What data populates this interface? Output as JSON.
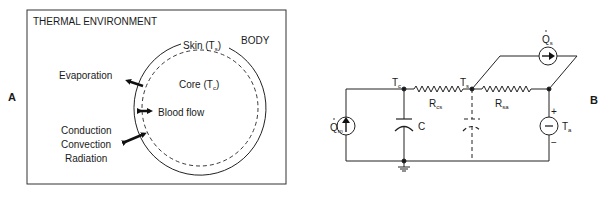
{
  "panel_a": {
    "letter": "A",
    "environment_label": "THERMAL ENVIRONMENT",
    "body_label": "BODY",
    "skin_label": "Skin (T",
    "skin_sub": "s",
    "core_label": "Core (T",
    "core_sub": "c",
    "close_paren": ")",
    "evaporation_label": "Evaporation",
    "blood_flow_label": "Blood flow",
    "conduction_label": "Conduction",
    "convection_label": "Convection",
    "radiation_label": "Radiation"
  },
  "panel_b": {
    "letter": "B",
    "qm_label": "Q",
    "qm_sub": "m",
    "qs_label": "Q",
    "qs_sub": "s",
    "tc_label": "T",
    "tc_sub": "c",
    "ts_label": "T",
    "ts_sub": "s",
    "rcs_label": "R",
    "rcs_sub": "cs",
    "rsa_label": "R",
    "rsa_sub": "sa",
    "c_label": "C",
    "ta_label": "T",
    "ta_sub": "a",
    "plus": "+",
    "minus": "−"
  }
}
